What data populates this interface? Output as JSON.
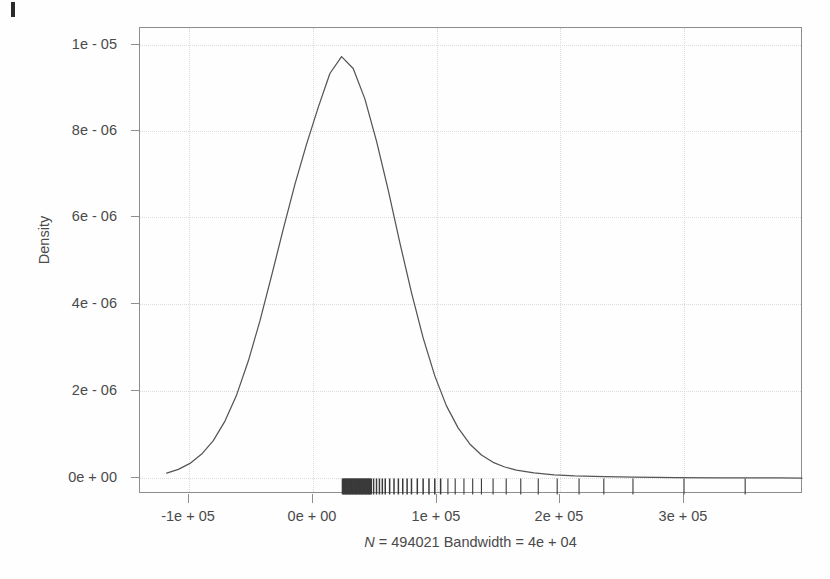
{
  "figure": {
    "type": "density-plot",
    "background": "#fefefe",
    "frame_color": "#8d8d8d",
    "text_color": "#4a4a4a",
    "curve_color": "#555555",
    "rug_color": "#3a3a3a",
    "grid_color": "#dcdcdc"
  },
  "axes": {
    "y_title": "Density",
    "x_caption_italic": "N",
    "x_caption_rest": " = 494021 Bandwidth = 4e + 04",
    "x_caption_full": "N = 494021 Bandwidth = 4e + 04"
  },
  "chart_data": {
    "type": "line",
    "title": "",
    "subtitle": "",
    "xlabel": "N = 494021 Bandwidth = 4e + 04",
    "ylabel": "Density",
    "xlim": [
      -139000,
      316000
    ],
    "ylim": [
      -3.2e-07,
      1.07e-05
    ],
    "grid": true,
    "legend": "none",
    "xticks": [
      -100000,
      0,
      100000,
      200000,
      300000
    ],
    "xticklabels": [
      "-1e + 05",
      "0e + 00",
      "1e + 05",
      "2e + 05",
      "3e + 05"
    ],
    "yticks": [
      0,
      2e-06,
      4e-06,
      6e-06,
      8e-06,
      1e-05
    ],
    "yticklabels": [
      "0e + 00",
      "2e - 06",
      "4e - 06",
      "6e - 06",
      "8e - 06",
      "1e - 05"
    ],
    "n": 494021,
    "bandwidth": 40000,
    "peak_x": 0,
    "peak_y": 1e-05,
    "series": [
      {
        "name": "density",
        "x": [
          -120000,
          -112000,
          -104000,
          -96000,
          -88000,
          -80000,
          -72000,
          -64000,
          -56000,
          -48000,
          -40000,
          -32000,
          -24000,
          -16000,
          -8000,
          0,
          8000,
          16000,
          24000,
          32000,
          40000,
          48000,
          56000,
          64000,
          72000,
          80000,
          88000,
          96000,
          104000,
          112000,
          120000,
          132000,
          146000,
          160000,
          180000,
          200000,
          230000,
          260000,
          300000,
          316000
        ],
        "y": [
          1.5e-07,
          2.4e-07,
          3.8e-07,
          6e-07,
          9.2e-07,
          1.38e-06,
          2e-06,
          2.8e-06,
          3.75e-06,
          4.82e-06,
          5.92e-06,
          6.98e-06,
          7.93e-06,
          8.8e-06,
          9.6e-06,
          1e-05,
          9.72e-06,
          9e-06,
          8e-06,
          6.85e-06,
          5.6e-06,
          4.42e-06,
          3.35e-06,
          2.45e-06,
          1.74e-06,
          1.22e-06,
          8.4e-07,
          5.8e-07,
          4.05e-07,
          2.95e-07,
          2.2e-07,
          1.55e-07,
          1.1e-07,
          8.5e-08,
          6.5e-08,
          5.5e-08,
          4.5e-08,
          4e-08,
          3.5e-08,
          3.2e-08
        ]
      }
    ],
    "rug": {
      "description": "dense cluster of tick marks just right of 0e + 00, thinning out to the right",
      "values": [
        1000,
        2000,
        3000,
        4000,
        5000,
        6000,
        7000,
        8000,
        9000,
        10000,
        11000,
        12000,
        13000,
        14000,
        15000,
        16000,
        17000,
        18000,
        19000,
        20000,
        22000,
        24000,
        26000,
        28000,
        30000,
        33000,
        36000,
        39000,
        42000,
        45000,
        48000,
        52000,
        56000,
        60000,
        64000,
        68000,
        73000,
        78000,
        84000,
        90000,
        96000,
        104000,
        113000,
        123000,
        135000,
        148000,
        163000,
        180000,
        200000,
        235000,
        277000
      ]
    }
  },
  "tick_labels": {
    "x": [
      "-1e + 05",
      "0e + 00",
      "1e + 05",
      "2e + 05",
      "3e + 05"
    ],
    "y": [
      "0e + 00",
      "2e - 06",
      "4e - 06",
      "6e - 06",
      "8e - 06",
      "1e - 05"
    ]
  }
}
